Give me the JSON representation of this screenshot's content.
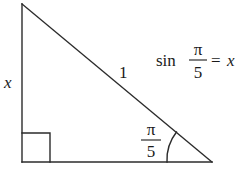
{
  "diagram": {
    "labels": {
      "side_vertical": "x",
      "hypotenuse": "1",
      "angle_numerator": "π",
      "angle_denominator": "5"
    },
    "equation": {
      "func": "sin",
      "numerator": "π",
      "denominator": "5",
      "equals": "=",
      "rhs": "x"
    },
    "right_angle_marker": true,
    "colors": {
      "stroke": "#2b2b2b",
      "text": "#1a1a1a",
      "background": "#ffffff"
    }
  }
}
